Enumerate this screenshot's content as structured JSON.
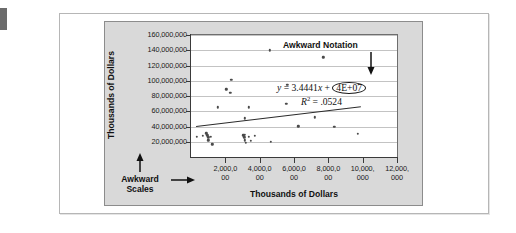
{
  "figure": {
    "annotations": {
      "awkward_scales": "Awkward",
      "awkward_scales_line2": "Scales",
      "awkward_notation": "Awkward Notation"
    }
  },
  "chart_data": {
    "type": "scatter",
    "title": "",
    "xlabel": "Thousands of Dollars",
    "ylabel": "Thousands of Dollars",
    "xlim": [
      0,
      12000000
    ],
    "ylim": [
      0,
      160000000
    ],
    "grid": true,
    "legend": "none",
    "y_tick_labels": [
      "160,000,000",
      "140,000,000",
      "120,000,000",
      "100,000,000",
      "80,000,000",
      "60,000,000",
      "40,000,000",
      "20,000,000"
    ],
    "y_tick_values": [
      160000000,
      140000000,
      120000000,
      100000000,
      80000000,
      60000000,
      40000000,
      20000000
    ],
    "x_tick_labels": [
      [
        "2,000,0",
        "00"
      ],
      [
        "4,000,0",
        "00"
      ],
      [
        "6,000,0",
        "00"
      ],
      [
        "8,000,0",
        "00"
      ],
      [
        "10,000,",
        "000"
      ],
      [
        "12,000,",
        "000"
      ]
    ],
    "x_tick_values": [
      2000000,
      4000000,
      6000000,
      8000000,
      10000000,
      12000000
    ],
    "trendline": {
      "equation_lhs": "y",
      "equation_eq": "=",
      "slope_term": "3.4441x",
      "plus": "+",
      "intercept_notation": "4E+07",
      "r_squared_label": "R",
      "r_squared_exp": "2",
      "r_squared_value": ".0524",
      "x_start": 300000,
      "y_start": 41000000,
      "x_end": 9900000,
      "y_end": 67000000
    },
    "points": [
      {
        "x": 4600000,
        "y": 140000000
      },
      {
        "x": 7700000,
        "y": 131000000
      },
      {
        "x": 2350000,
        "y": 101000000
      },
      {
        "x": 2050000,
        "y": 89000000
      },
      {
        "x": 2300000,
        "y": 84500000
      },
      {
        "x": 5600000,
        "y": 95000000
      },
      {
        "x": 5550000,
        "y": 70000000
      },
      {
        "x": 1550000,
        "y": 65000000
      },
      {
        "x": 3350000,
        "y": 65000000
      },
      {
        "x": 3150000,
        "y": 50500000
      },
      {
        "x": 7200000,
        "y": 52000000
      },
      {
        "x": 6250000,
        "y": 40500000
      },
      {
        "x": 8350000,
        "y": 40000000
      },
      {
        "x": 9700000,
        "y": 30500000
      },
      {
        "x": 350000,
        "y": 26500000
      },
      {
        "x": 700000,
        "y": 28000000
      },
      {
        "x": 900000,
        "y": 31000000
      },
      {
        "x": 950000,
        "y": 28500000
      },
      {
        "x": 1000000,
        "y": 26000000
      },
      {
        "x": 1150000,
        "y": 26500000
      },
      {
        "x": 1000000,
        "y": 22000000
      },
      {
        "x": 1250000,
        "y": 16500000
      },
      {
        "x": 3050000,
        "y": 28500000
      },
      {
        "x": 3150000,
        "y": 29500000
      },
      {
        "x": 3100000,
        "y": 26000000
      },
      {
        "x": 3350000,
        "y": 26500000
      },
      {
        "x": 3700000,
        "y": 28000000
      },
      {
        "x": 3150000,
        "y": 22000000
      },
      {
        "x": 3200000,
        "y": 19000000
      },
      {
        "x": 3500000,
        "y": 21500000
      },
      {
        "x": 4650000,
        "y": 20000000
      }
    ]
  }
}
